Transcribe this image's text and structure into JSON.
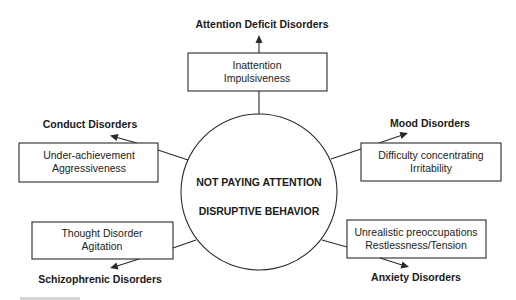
{
  "center": {
    "line1": "NOT PAYING ATTENTION",
    "line2": "DISRUPTIVE BEHAVIOR"
  },
  "nodes": [
    {
      "id": "top",
      "disorder": "Attention Deficit Disorders",
      "symptoms": [
        "Inattention",
        "Impulsiveness"
      ]
    },
    {
      "id": "upper-left",
      "disorder": "Conduct Disorders",
      "symptoms": [
        "Under-achievement",
        "Aggressiveness"
      ]
    },
    {
      "id": "upper-right",
      "disorder": "Mood Disorders",
      "symptoms": [
        "Difficulty concentrating",
        "Irritability"
      ]
    },
    {
      "id": "lower-left",
      "disorder": "Schizophrenic Disorders",
      "symptoms": [
        "Thought Disorder",
        "Agitation"
      ]
    },
    {
      "id": "lower-right",
      "disorder": "Anxiety Disorders",
      "symptoms": [
        "Unrealistic preoccupations",
        "Restlessness/Tension"
      ]
    }
  ],
  "colors": {
    "stroke": "#2a2a2a",
    "text": "#1a1a1a",
    "background": "#ffffff"
  }
}
